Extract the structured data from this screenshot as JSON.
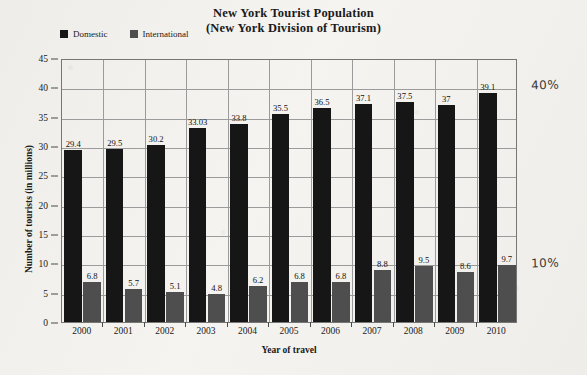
{
  "chart_data": {
    "type": "bar",
    "title": "New York Tourist Population",
    "subtitle": "(New York Division of Tourism)",
    "xlabel": "Year of travel",
    "ylabel": "Number of tourists (in millions)",
    "ylim": [
      0,
      45
    ],
    "ytick_step": 5,
    "yticks": [
      0,
      5,
      10,
      15,
      20,
      25,
      30,
      35,
      40,
      45
    ],
    "grid": true,
    "legend_position": "top-left",
    "categories": [
      "2000",
      "2001",
      "2002",
      "2003",
      "2004",
      "2005",
      "2006",
      "2007",
      "2008",
      "2009",
      "2010"
    ],
    "series": [
      {
        "name": "Domestic",
        "color": "#161616",
        "values": [
          29.4,
          29.5,
          30.2,
          33.03,
          33.8,
          35.5,
          36.5,
          37.1,
          37.5,
          37,
          39.1
        ],
        "labels": [
          "29.4",
          "29.5",
          "30.2",
          "33.03",
          "33.8",
          "35.5",
          "36.5",
          "37.1",
          "37.5",
          "37",
          "39.1"
        ]
      },
      {
        "name": "International",
        "color": "#4e4e4e",
        "values": [
          6.8,
          5.7,
          5.1,
          4.8,
          6.2,
          6.8,
          6.8,
          8.8,
          9.5,
          8.6,
          9.7
        ],
        "labels": [
          "6.8",
          "5.7",
          "5.1",
          "4.8",
          "6.2",
          "6.8",
          "6.8",
          "8.8",
          "9.5",
          "8.6",
          "9.7"
        ]
      }
    ],
    "annotations": [
      {
        "text": "40%",
        "x": 531,
        "y": 78
      },
      {
        "text": "10%",
        "x": 531,
        "y": 256
      }
    ]
  }
}
